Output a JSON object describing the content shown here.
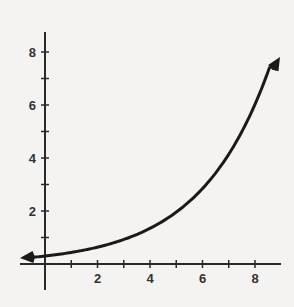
{
  "chart_data": {
    "type": "line",
    "title": "",
    "xlabel": "",
    "ylabel": "",
    "xlim": [
      -1,
      9
    ],
    "ylim": [
      -1,
      9
    ],
    "grid": false,
    "legend": null,
    "x_ticks": [
      1,
      2,
      3,
      4,
      5,
      6,
      7,
      8
    ],
    "x_tick_labels": [
      "2",
      "4",
      "6",
      "8"
    ],
    "x_tick_label_values": [
      2,
      4,
      6,
      8
    ],
    "y_ticks": [
      1,
      2,
      3,
      4,
      5,
      6,
      7,
      8
    ],
    "y_tick_labels": [
      "2",
      "4",
      "6",
      "8"
    ],
    "y_tick_label_values": [
      2,
      4,
      6,
      8
    ],
    "series": [
      {
        "name": "exponential curve",
        "description": "Exponential growth curve with arrowheads at both ends, approx y = 0.3 * 1.455^x",
        "x": [
          -0.9,
          0,
          1,
          2,
          3,
          4,
          5,
          6,
          7,
          8,
          8.8
        ],
        "values": [
          0.21,
          0.3,
          0.44,
          0.64,
          0.92,
          1.34,
          1.95,
          2.84,
          4.13,
          6.01,
          8.0
        ]
      }
    ],
    "color": "#1a1a1a"
  }
}
